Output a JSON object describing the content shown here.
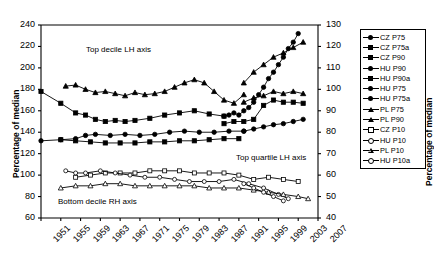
{
  "chart_data": {
    "type": "line",
    "title": "",
    "xlabel": "",
    "ylabel": "Percentage of median",
    "ylabel_right": "Percentage of median",
    "xlim": [
      1951,
      2007
    ],
    "ylim": [
      60,
      240
    ],
    "ylim_right": [
      40,
      130
    ],
    "grid": false,
    "legend_position": "right-outside",
    "xticks": [
      "1951",
      "1955",
      "1959",
      "1963",
      "1967",
      "1971",
      "1975",
      "1979",
      "1983",
      "1987",
      "1991",
      "1995",
      "1999",
      "2003",
      "2007"
    ],
    "yticks_left": [
      "60",
      "80",
      "100",
      "120",
      "140",
      "160",
      "180",
      "200",
      "220",
      "240"
    ],
    "yticks_right": [
      "40",
      "50",
      "60",
      "70",
      "80",
      "90",
      "100",
      "110",
      "120",
      "130"
    ],
    "annotations": [
      {
        "text": "Top decile LH axis",
        "x": 1963,
        "y": 205
      },
      {
        "text": "Top quartile LH axis",
        "x": 1992,
        "y": 133
      },
      {
        "text": "Bottom decile RH axis",
        "x": 1956,
        "y": 88
      }
    ],
    "series": [
      {
        "name": "CZ P75",
        "marker": "circle-filled",
        "axis": "left",
        "x": [
          1988,
          1989,
          1990,
          1991,
          1992,
          1993,
          1994,
          1995,
          1996,
          1997,
          1998,
          1999,
          2000,
          2001,
          2002,
          2003
        ],
        "values": [
          155,
          156,
          158,
          156,
          160,
          163,
          168,
          175,
          182,
          190,
          196,
          203,
          210,
          218,
          224,
          232
        ]
      },
      {
        "name": "CZ P75a",
        "marker": "square-filled",
        "axis": "left",
        "x": [
          1988,
          1990,
          1992,
          1994,
          1996,
          1998,
          2000,
          2002,
          2004
        ],
        "values": [
          148,
          150,
          150,
          152,
          165,
          170,
          168,
          168,
          167
        ]
      },
      {
        "name": "CZ P90",
        "marker": "square-filled",
        "axis": "left",
        "x": [
          1951,
          1955,
          1958,
          1960,
          1962,
          1964,
          1966,
          1968,
          1970,
          1973,
          1976,
          1979,
          1982,
          1985,
          1988
        ],
        "values": [
          178,
          167,
          158,
          156,
          152,
          150,
          151,
          150,
          151,
          153,
          156,
          158,
          160,
          157,
          155
        ]
      },
      {
        "name": "HU P90",
        "marker": "triangle-filled",
        "axis": "left",
        "x": [
          1956,
          1958,
          1960,
          1962,
          1964,
          1966,
          1968,
          1970,
          1972,
          1974,
          1976,
          1978,
          1980,
          1982,
          1984,
          1986,
          1988,
          1990,
          1992
        ],
        "values": [
          183,
          184,
          180,
          177,
          178,
          176,
          174,
          177,
          175,
          176,
          178,
          182,
          186,
          189,
          186,
          178,
          170,
          167,
          175
        ]
      },
      {
        "name": "HU P90a",
        "marker": "triangle-filled",
        "axis": "left",
        "x": [
          1992,
          1994,
          1996,
          1998,
          2000,
          2002,
          2004
        ],
        "values": [
          186,
          196,
          203,
          210,
          214,
          219,
          224
        ]
      },
      {
        "name": "HU P75",
        "marker": "circle-filled",
        "axis": "left",
        "x": [
          1951,
          1955,
          1958,
          1960,
          1962,
          1965,
          1968,
          1971,
          1974,
          1977,
          1980,
          1983,
          1986,
          1989,
          1992
        ],
        "values": [
          132,
          133,
          134,
          137,
          138,
          137,
          138,
          137,
          138,
          140,
          141,
          140,
          140,
          141,
          141
        ]
      },
      {
        "name": "HU P75a",
        "marker": "circle-filled",
        "axis": "left",
        "x": [
          1992,
          1994,
          1996,
          1998,
          2000,
          2002,
          2004
        ],
        "values": [
          141,
          143,
          145,
          147,
          148,
          150,
          152
        ]
      },
      {
        "name": "PL P75",
        "marker": "square-filled",
        "axis": "left",
        "x": [
          1955,
          1958,
          1961,
          1964,
          1967,
          1970,
          1973,
          1976,
          1979,
          1982,
          1985,
          1988,
          1991
        ],
        "values": [
          133,
          132,
          131,
          130,
          130,
          130,
          131,
          131,
          132,
          132,
          133,
          134,
          134
        ]
      },
      {
        "name": "PL P90",
        "marker": "triangle-filled",
        "axis": "left",
        "x": [
          1992,
          1994,
          1996,
          1998,
          2000,
          2002,
          2004
        ],
        "values": [
          168,
          172,
          174,
          178,
          176,
          178,
          176
        ]
      },
      {
        "name": "CZ P10",
        "marker": "square-open",
        "axis": "right",
        "x": [
          1958,
          1961,
          1964,
          1967,
          1970,
          1973,
          1976,
          1979,
          1982,
          1985,
          1988,
          1991,
          1994,
          1997,
          2000,
          2003
        ],
        "values": [
          59,
          60,
          61,
          61,
          61,
          62,
          62,
          62,
          61,
          61,
          61,
          60,
          58,
          59,
          58,
          57
        ]
      },
      {
        "name": "HU P10",
        "marker": "circle-open",
        "axis": "right",
        "x": [
          1956,
          1958,
          1960,
          1963,
          1966,
          1969,
          1972,
          1975,
          1978,
          1981,
          1984,
          1987,
          1990,
          1993,
          1996,
          1999,
          2001
        ],
        "values": [
          62,
          61,
          61,
          62,
          61,
          60,
          59,
          59,
          58,
          57,
          57,
          57,
          58,
          56,
          54,
          51,
          49
        ]
      },
      {
        "name": "PL P10",
        "marker": "triangle-open",
        "axis": "right",
        "x": [
          1955,
          1958,
          1961,
          1964,
          1967,
          1970,
          1973,
          1976,
          1979,
          1982,
          1985,
          1988,
          1991,
          1994,
          1997,
          2000,
          2003,
          2005
        ],
        "values": [
          54,
          55,
          55,
          56,
          56,
          55,
          55,
          55,
          55,
          55,
          54,
          54,
          54,
          53,
          52,
          51,
          50,
          49
        ]
      },
      {
        "name": "HU P10a",
        "marker": "circle-open",
        "axis": "right",
        "x": [
          1992,
          1994,
          1996,
          1998,
          2000
        ],
        "values": [
          56,
          54,
          52,
          50,
          48
        ]
      }
    ],
    "legend": [
      {
        "label": "CZ P75",
        "marker": "circle-filled"
      },
      {
        "label": "CZ P75a",
        "marker": "square-filled"
      },
      {
        "label": "CZ P90",
        "marker": "square-filled"
      },
      {
        "label": "HU P90",
        "marker": "circle-filled"
      },
      {
        "label": "HU P90a",
        "marker": "square-filled"
      },
      {
        "label": "HU P75",
        "marker": "circle-filled"
      },
      {
        "label": "HU P75a",
        "marker": "circle-filled"
      },
      {
        "label": "PL P75",
        "marker": "triangle-filled"
      },
      {
        "label": "PL P90",
        "marker": "triangle-filled"
      },
      {
        "label": "CZ P10",
        "marker": "square-open"
      },
      {
        "label": "HU P10",
        "marker": "circle-open"
      },
      {
        "label": "PL P10",
        "marker": "triangle-open"
      },
      {
        "label": "HU P10a",
        "marker": "circle-open"
      }
    ]
  }
}
